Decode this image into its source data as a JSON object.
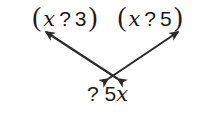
{
  "figure": {
    "background_color": "#ffffff",
    "ink_color": "#1b1b1b",
    "arrow_color": "#2a2a2a"
  },
  "top_row": {
    "factor_left": {
      "open_paren": "(",
      "variable": "x",
      "operator": "?",
      "constant": "3",
      "close_paren": ")"
    },
    "factor_right": {
      "open_paren": "(",
      "variable": "x",
      "operator": "?",
      "constant": "5",
      "close_paren": ")"
    }
  },
  "bottom_row": {
    "term": {
      "operator": "?",
      "coefficient": "5",
      "variable": "x"
    }
  },
  "arrows": [
    {
      "name": "arrow-left",
      "style": "double-headed",
      "from_x": 118,
      "from_y": 79,
      "to_x": 46,
      "to_y": 32
    },
    {
      "name": "arrow-right",
      "style": "double-headed",
      "from_x": 108,
      "from_y": 79,
      "to_x": 178,
      "to_y": 32
    }
  ]
}
